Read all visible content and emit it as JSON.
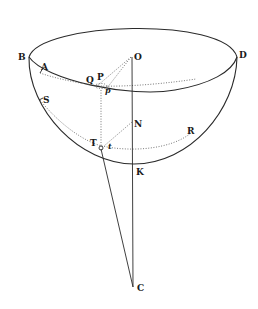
{
  "diagram": {
    "type": "hemisphere-geometry",
    "labels": {
      "B": "B",
      "D": "D",
      "O": "O",
      "A": "A",
      "Q": "Q",
      "P": "P",
      "p": "p",
      "S": "S",
      "N": "N",
      "R": "R",
      "T": "T",
      "t": "t",
      "K": "K",
      "C": "C"
    },
    "colors": {
      "ink": "#2a2a2a",
      "background": "#ffffff"
    }
  }
}
